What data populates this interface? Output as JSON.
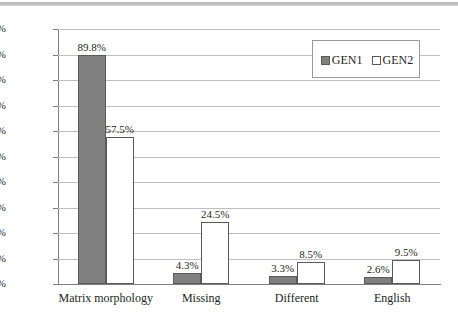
{
  "chart_data": {
    "type": "bar",
    "title": "",
    "xlabel": "",
    "ylabel": "",
    "grid": true,
    "legend_position": "top-right",
    "ylim": [
      0,
      100
    ],
    "ytick_labels": [
      "100.0%",
      "90.0%",
      "80.0%",
      "70.0%",
      "60.0%",
      "50.0%",
      "40.0%",
      "30.0%",
      "20.0%",
      "10.0%",
      "0.0%"
    ],
    "ytick_values": [
      100,
      90,
      80,
      70,
      60,
      50,
      40,
      30,
      20,
      10,
      0
    ],
    "categories": [
      "Matrix morphology",
      "Missing",
      "Different",
      "English"
    ],
    "series": [
      {
        "name": "GEN1",
        "color": "#808080",
        "values": [
          89.8,
          4.3,
          3.3,
          2.6
        ],
        "labels": [
          "89.8%",
          "4.3%",
          "3.3%",
          "2.6%"
        ]
      },
      {
        "name": "GEN2",
        "color": "#ffffff",
        "values": [
          57.5,
          24.5,
          8.5,
          9.5
        ],
        "labels": [
          "57.5%",
          "24.5%",
          "8.5%",
          "9.5%"
        ]
      }
    ]
  },
  "legend": {
    "entries": [
      {
        "label": "GEN1",
        "swatch": "filled-gray-square-icon"
      },
      {
        "label": "GEN2",
        "swatch": "empty-white-square-icon"
      }
    ]
  }
}
